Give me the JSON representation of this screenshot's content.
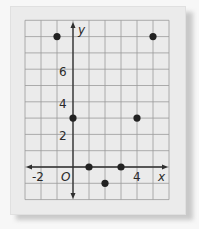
{
  "chart_data": {
    "type": "scatter",
    "title": "",
    "xlabel": "x",
    "ylabel": "y",
    "xlim": [
      -3,
      6
    ],
    "ylim": [
      -2,
      9
    ],
    "grid": true,
    "x_tick_labels": [
      "-2",
      "O",
      "4"
    ],
    "y_tick_labels": [
      "2",
      "4",
      "6"
    ],
    "series": [
      {
        "name": "points",
        "points": [
          {
            "x": -1,
            "y": 8
          },
          {
            "x": 0,
            "y": 3
          },
          {
            "x": 1,
            "y": 0
          },
          {
            "x": 2,
            "y": -1
          },
          {
            "x": 3,
            "y": 0
          },
          {
            "x": 4,
            "y": 3
          },
          {
            "x": 5,
            "y": 8
          }
        ]
      }
    ]
  },
  "labels": {
    "x_axis": "x",
    "y_axis": "y",
    "origin": "O",
    "x_neg2": "-2",
    "x_4": "4",
    "y_2": "2",
    "y_4": "4",
    "y_6": "6"
  },
  "colors": {
    "paper": "#ebebeb",
    "grid": "#9a9a9a",
    "axis": "#2f2f2f",
    "point": "#222222"
  }
}
